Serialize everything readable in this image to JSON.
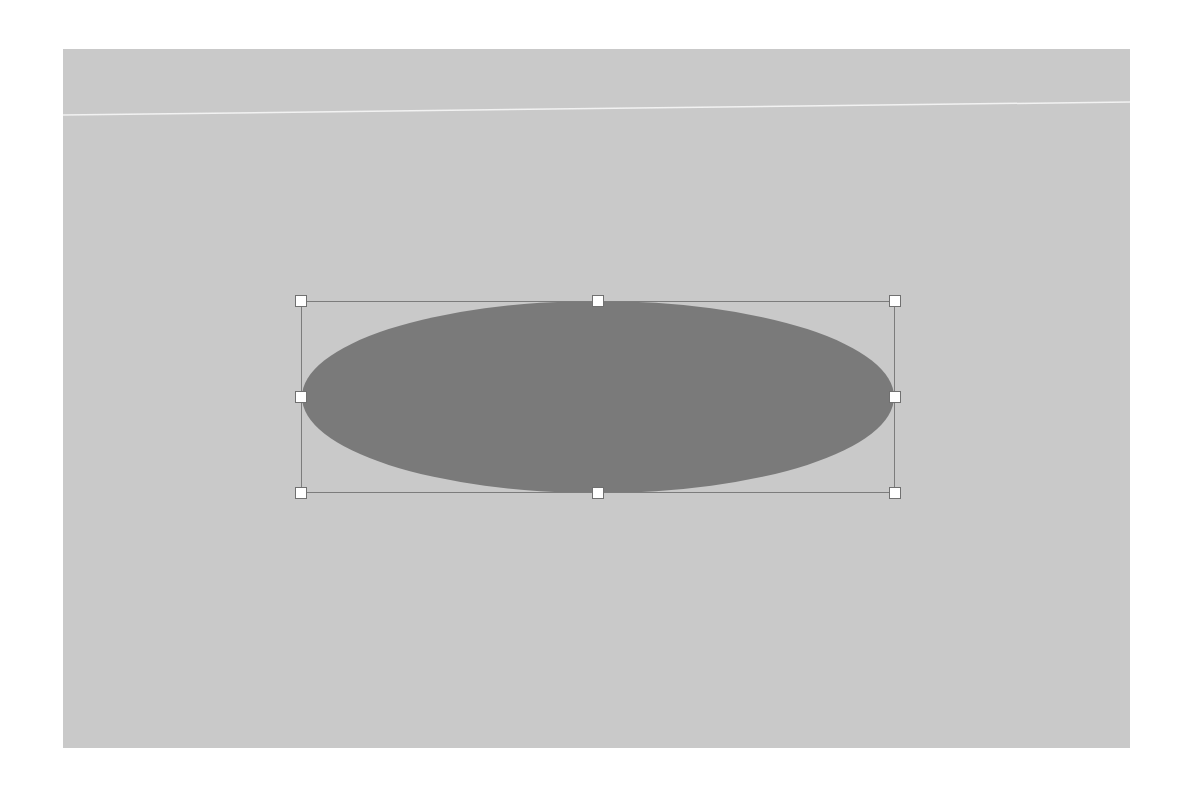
{
  "canvas": {
    "background": "#c9c9c9"
  },
  "guide_line": {
    "color": "#f2f2f2"
  },
  "shape": {
    "type": "ellipse",
    "fill": "#7a7a7a",
    "selected": true,
    "bounding_box_color": "#7c7c7c"
  },
  "handles": [
    "top-left",
    "top-center",
    "top-right",
    "middle-left",
    "middle-right",
    "bottom-left",
    "bottom-center",
    "bottom-right"
  ]
}
